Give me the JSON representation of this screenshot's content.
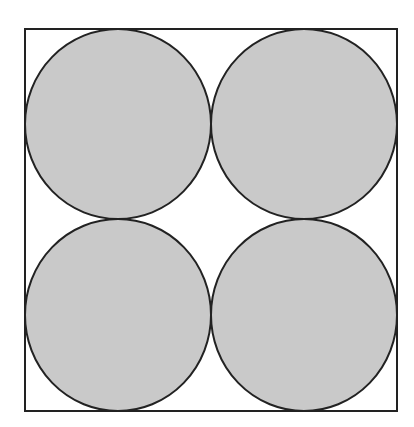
{
  "diagram": {
    "canvas": {
      "width": 414,
      "height": 427,
      "background": "#ffffff"
    },
    "square": {
      "x": 25,
      "y": 29,
      "width": 372,
      "height": 382,
      "stroke": "#222222",
      "stroke_width": 2,
      "fill": "none"
    },
    "circles": [
      {
        "name": "top-left",
        "cx": 118,
        "cy": 124,
        "rx": 93,
        "ry": 95
      },
      {
        "name": "top-right",
        "cx": 304,
        "cy": 124,
        "rx": 93,
        "ry": 95
      },
      {
        "name": "bottom-left",
        "cx": 118,
        "cy": 315,
        "rx": 93,
        "ry": 96
      },
      {
        "name": "bottom-right",
        "cx": 304,
        "cy": 315,
        "rx": 93,
        "ry": 96
      }
    ],
    "circle_style": {
      "fill": "#c9c9c9",
      "stroke": "#222222",
      "stroke_width": 2
    }
  }
}
